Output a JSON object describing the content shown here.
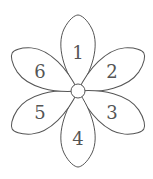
{
  "diagram": {
    "type": "flower",
    "center": {
      "x": 78,
      "y": 91,
      "r": 7
    },
    "petals": [
      {
        "id": 1,
        "label": "1",
        "angle": -90
      },
      {
        "id": 2,
        "label": "2",
        "angle": -30
      },
      {
        "id": 3,
        "label": "3",
        "angle": 30
      },
      {
        "id": 4,
        "label": "4",
        "angle": 90
      },
      {
        "id": 5,
        "label": "5",
        "angle": 150
      },
      {
        "id": 6,
        "label": "6",
        "angle": -150
      }
    ],
    "colors": {
      "stroke": "#555555",
      "fill": "#ffffff",
      "text": "#555555"
    }
  }
}
